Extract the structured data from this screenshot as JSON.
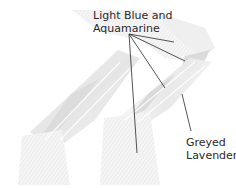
{
  "figure": {
    "labels": [
      {
        "id": "top",
        "lines": [
          "Light Blue and",
          "Aquamarine"
        ]
      },
      {
        "id": "side",
        "lines": [
          "Greyed",
          "Lavender"
        ]
      }
    ],
    "colors": {
      "ribbon_light": "#ededed",
      "ribbon_mid": "#dcdcdc",
      "ribbon_dark": "#c4c4c4",
      "leader_line": "#2a2a2a",
      "text": "#2a2a2a"
    },
    "callouts": {
      "top_origin": [
        129,
        34
      ],
      "top_targets": [
        [
          174,
          42
        ],
        [
          185,
          61
        ],
        [
          165,
          88
        ],
        [
          137,
          153
        ]
      ],
      "side_line": [
        [
          182,
          94
        ],
        [
          191,
          131
        ]
      ]
    }
  }
}
